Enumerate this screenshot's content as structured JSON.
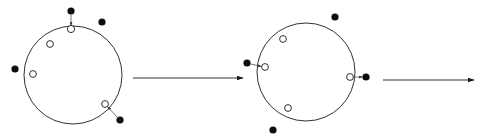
{
  "diagram": {
    "background_color": "#ffffff",
    "stroke_color": "#1a1a1a",
    "filled_marker_color": "#0d0d0d",
    "open_marker_fill": "#ffffff",
    "connector_color": "#3a3a3a",
    "width": 480,
    "height": 139,
    "stages": [
      {
        "name": "stage-1",
        "label": "",
        "circle": {
          "cx": 73,
          "cy": 75,
          "r": 49
        },
        "open_markers": [
          {
            "name": "open-marker-top",
            "cx": 71,
            "cy": 29,
            "r": 3.6
          },
          {
            "name": "open-marker-upper-left",
            "cx": 50,
            "cy": 44,
            "r": 3.4
          },
          {
            "name": "open-marker-left",
            "cx": 33,
            "cy": 74,
            "r": 3.4
          },
          {
            "name": "open-marker-lower-right",
            "cx": 105,
            "cy": 104,
            "r": 3.4
          }
        ],
        "filled_markers": [
          {
            "name": "filled-marker-top",
            "cx": 71,
            "cy": 11,
            "r": 3.6
          },
          {
            "name": "filled-marker-upper-right",
            "cx": 102,
            "cy": 22,
            "r": 3.6
          },
          {
            "name": "filled-marker-left-outside",
            "cx": 15,
            "cy": 69,
            "r": 3.6
          },
          {
            "name": "filled-marker-lower-right",
            "cx": 120,
            "cy": 120,
            "r": 3.6
          }
        ],
        "connectors": [
          {
            "name": "connector-top",
            "x1": 71,
            "y1": 14.6,
            "x2": 71,
            "y2": 25.4
          },
          {
            "name": "connector-lower-right",
            "x1": 117.4,
            "y1": 117.4,
            "x2": 107.5,
            "y2": 106.5
          }
        ]
      },
      {
        "name": "stage-2",
        "label": "",
        "circle": {
          "cx": 306,
          "cy": 72,
          "r": 49
        },
        "open_markers": [
          {
            "name": "open-marker-left",
            "cx": 265,
            "cy": 67,
            "r": 3.4
          },
          {
            "name": "open-marker-upper-left",
            "cx": 283,
            "cy": 39,
            "r": 3.4
          },
          {
            "name": "open-marker-lower-left",
            "cx": 288,
            "cy": 108,
            "r": 3.4
          },
          {
            "name": "open-marker-right",
            "cx": 350,
            "cy": 77,
            "r": 3.4
          }
        ],
        "filled_markers": [
          {
            "name": "filled-marker-left-outside",
            "cx": 247,
            "cy": 63,
            "r": 3.6
          },
          {
            "name": "filled-marker-upper-right",
            "cx": 335,
            "cy": 17,
            "r": 3.6
          },
          {
            "name": "filled-marker-right-outside",
            "cx": 366,
            "cy": 77,
            "r": 3.6
          },
          {
            "name": "filled-marker-bottom-outside",
            "cx": 273,
            "cy": 130,
            "r": 3.6
          }
        ],
        "connectors": [
          {
            "name": "connector-left",
            "x1": 250.6,
            "y1": 64,
            "x2": 261.4,
            "y2": 66.4
          },
          {
            "name": "connector-right",
            "x1": 353.6,
            "y1": 77,
            "x2": 362.4,
            "y2": 77
          }
        ]
      }
    ],
    "process_arrows": [
      {
        "name": "process-arrow-1",
        "x1": 133,
        "y1": 78,
        "x2": 243,
        "y2": 78
      },
      {
        "name": "process-arrow-2",
        "x1": 383,
        "y1": 80,
        "x2": 474,
        "y2": 80
      }
    ]
  }
}
